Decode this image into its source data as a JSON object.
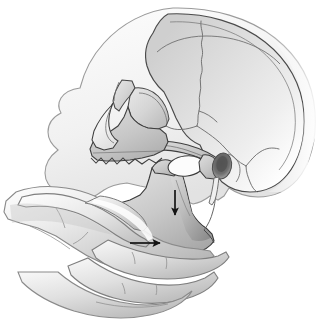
{
  "figure": {
    "title": "Jaw thrust maneuver on lateral skull",
    "background_color": "#ffffff",
    "canvas": {
      "width": 325,
      "height": 329
    }
  },
  "palette": {
    "background": "#ffffff",
    "outline": "#3a3a3a",
    "outline_soft": "#8d8d8d",
    "bone_light": "#e9e9e9",
    "bone_mid": "#cfcfcf",
    "bone_dark": "#a9a9a9",
    "bone_shadow": "#8f8f8f",
    "cranium_fill": "#dcdcdc",
    "skin_light": "#f0f0f0",
    "skin_mid": "#d2d2d2",
    "skin_dark": "#a8a8a8",
    "soft_tissue": "#f4f4f4",
    "meatus_dark": "#5a5a5a",
    "notch_white": "#fbfbfb",
    "arrow_color": "#141414"
  },
  "structures": [
    {
      "id": "soft-tissue-profile",
      "label": "Facial soft tissue profile",
      "interactable": false
    },
    {
      "id": "cranial-vault",
      "label": "Cranial vault (frontal, parietal, occipital)",
      "interactable": false
    },
    {
      "id": "coronal-suture",
      "label": "Coronal suture",
      "interactable": false
    },
    {
      "id": "squamous-suture",
      "label": "Squamous suture",
      "interactable": false
    },
    {
      "id": "lambdoid-suture",
      "label": "Lambdoid suture",
      "interactable": false
    },
    {
      "id": "orbit",
      "label": "Orbital rim / orbit",
      "interactable": false
    },
    {
      "id": "nasal-bones",
      "label": "Nasal bones",
      "interactable": false
    },
    {
      "id": "nasal-aperture",
      "label": "Piriform nasal aperture",
      "interactable": false
    },
    {
      "id": "zygomatic-arch",
      "label": "Zygomatic arch",
      "interactable": false
    },
    {
      "id": "maxilla",
      "label": "Maxilla with upper dentition",
      "interactable": false
    },
    {
      "id": "mandible",
      "label": "Mandible (ramus, body, angle)",
      "interactable": false
    },
    {
      "id": "coronoid-process",
      "label": "Coronoid process",
      "interactable": false
    },
    {
      "id": "mandibular-notch",
      "label": "Mandibular notch",
      "interactable": false
    },
    {
      "id": "condylar-process",
      "label": "Condylar process / TMJ",
      "interactable": false
    },
    {
      "id": "external-acoustic-meatus",
      "label": "External acoustic meatus",
      "interactable": false
    },
    {
      "id": "styloid-process",
      "label": "Styloid process",
      "interactable": false
    },
    {
      "id": "hand",
      "label": "Clinician hand grasping mandible",
      "interactable": false
    },
    {
      "id": "thumb",
      "label": "Thumb over mandibular body",
      "interactable": false
    },
    {
      "id": "fingers",
      "label": "Fingers cupping inferior mandibular border",
      "interactable": false
    }
  ],
  "annotations": {
    "arrows": [
      {
        "id": "arrow-downward",
        "label": "Downward mandibular displacement",
        "direction": "down",
        "color": "#141414",
        "x1": 175,
        "y1": 190,
        "x2": 175,
        "y2": 215
      },
      {
        "id": "arrow-forward",
        "label": "Forward (anterior) mandibular displacement",
        "direction": "right",
        "color": "#141414",
        "x1": 130,
        "y1": 243,
        "x2": 160,
        "y2": 243
      }
    ]
  }
}
